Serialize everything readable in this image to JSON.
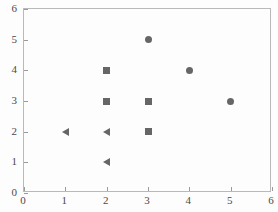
{
  "chart_data": {
    "type": "scatter",
    "title": "",
    "xlabel": "",
    "ylabel": "",
    "xlim": [
      0,
      6
    ],
    "ylim": [
      0,
      6
    ],
    "x_ticks": [
      0,
      1,
      2,
      3,
      4,
      5,
      6
    ],
    "y_ticks": [
      0,
      1,
      2,
      3,
      4,
      5,
      6
    ],
    "grid": false,
    "legend": "none",
    "marker_color": "#666666",
    "frame_color": "#b9b9b9",
    "background": "#fdfdfd",
    "series": [
      {
        "name": "circle-series",
        "marker": "circle",
        "color": "#666666",
        "points": [
          {
            "x": 3,
            "y": 5
          },
          {
            "x": 4,
            "y": 4
          },
          {
            "x": 5,
            "y": 3
          }
        ]
      },
      {
        "name": "square-series",
        "marker": "square",
        "color": "#666666",
        "points": [
          {
            "x": 2,
            "y": 4
          },
          {
            "x": 2,
            "y": 3
          },
          {
            "x": 3,
            "y": 3
          },
          {
            "x": 3,
            "y": 2
          }
        ]
      },
      {
        "name": "triangle-left-series",
        "marker": "triangle-left",
        "color": "#666666",
        "points": [
          {
            "x": 1,
            "y": 2
          },
          {
            "x": 2,
            "y": 2
          },
          {
            "x": 2,
            "y": 1
          }
        ]
      }
    ]
  }
}
